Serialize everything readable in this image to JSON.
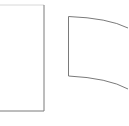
{
  "diagram": {
    "background": "#ffffff",
    "stroke_color": "#7a7a7a",
    "shapes": [
      {
        "name": "flat-rectangle",
        "kind": "rectangle",
        "x": 0,
        "y": 5,
        "width": 44,
        "height": 106
      },
      {
        "name": "curved-sheet",
        "kind": "curved-quad",
        "left_x": 68,
        "top_y": 16,
        "bottom_y": 76
      }
    ]
  }
}
